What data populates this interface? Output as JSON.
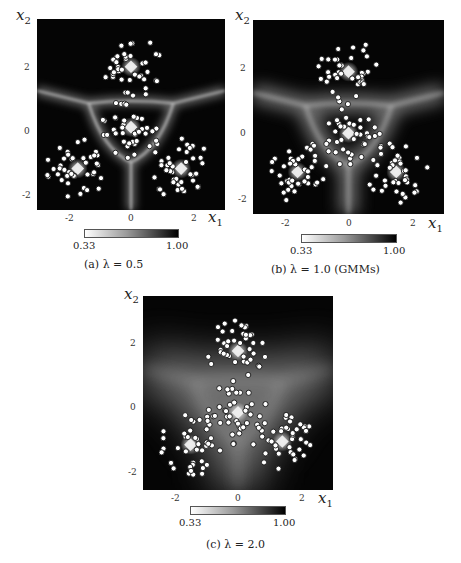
{
  "chart_data": [
    {
      "type": "heatmap",
      "title": "(a) λ = 0.5",
      "subplot_label": "(a)",
      "lambda": "0.5",
      "xlabel": "x1",
      "ylabel": "x2",
      "xticks": [
        "-2",
        "0",
        "2"
      ],
      "yticks": [
        "2",
        "0",
        "-2"
      ],
      "xlim": [
        -3,
        3
      ],
      "ylim": [
        -2.5,
        3.5
      ],
      "colorbar": {
        "min_label": "0.33",
        "max_label": "1.00",
        "min": 0.33,
        "max": 1.0,
        "gradient": "white-to-black"
      },
      "cluster_centers": [
        [
          0.0,
          2.0
        ],
        [
          0.0,
          0.1
        ],
        [
          -1.7,
          -1.2
        ],
        [
          1.6,
          -1.2
        ]
      ],
      "boundary_sharpness": "sharp",
      "points_per_cluster_approx": 40
    },
    {
      "type": "heatmap",
      "title": "(b) λ = 1.0 (GMMs)",
      "subplot_label": "(b)",
      "lambda": "1.0",
      "note": "(GMMs)",
      "xlabel": "x1",
      "ylabel": "x2",
      "xticks": [
        "-2",
        "0",
        "2"
      ],
      "yticks": [
        "2",
        "0",
        "-2"
      ],
      "xlim": [
        -3,
        3
      ],
      "ylim": [
        -2.5,
        3.5
      ],
      "colorbar": {
        "min_label": "0.33",
        "max_label": "1.00",
        "min": 0.33,
        "max": 1.0,
        "gradient": "white-to-black"
      },
      "cluster_centers": [
        [
          0.0,
          1.9
        ],
        [
          0.0,
          0.0
        ],
        [
          -1.6,
          -1.2
        ],
        [
          1.5,
          -1.2
        ]
      ],
      "boundary_sharpness": "medium",
      "points_per_cluster_approx": 40
    },
    {
      "type": "heatmap",
      "title": "(c) λ = 2.0",
      "subplot_label": "(c)",
      "lambda": "2.0",
      "xlabel": "x1",
      "ylabel": "x2",
      "xticks": [
        "-2",
        "0",
        "2"
      ],
      "yticks": [
        "2",
        "0",
        "-2"
      ],
      "xlim": [
        -3,
        3
      ],
      "ylim": [
        -2.5,
        3.5
      ],
      "colorbar": {
        "min_label": "0.33",
        "max_label": "1.00",
        "min": 0.33,
        "max": 1.0,
        "gradient": "white-to-black"
      },
      "cluster_centers": [
        [
          0.0,
          1.8
        ],
        [
          0.0,
          -0.1
        ],
        [
          -1.5,
          -1.1
        ],
        [
          1.4,
          -1.0
        ]
      ],
      "boundary_sharpness": "diffuse",
      "points_per_cluster_approx": 40
    }
  ],
  "panels": {
    "a": {
      "caption": "(a) λ = 0.5",
      "x1": "x",
      "x1_sub": "1",
      "x2": "x",
      "x2_sub": "2",
      "ticks_x": [
        "-2",
        "0",
        "2"
      ],
      "ticks_y": [
        "2",
        "0",
        "-2"
      ],
      "cb_min": "0.33",
      "cb_max": "1.00"
    },
    "b": {
      "caption": "(b) λ = 1.0 (GMMs)",
      "x1": "x",
      "x1_sub": "1",
      "x2": "x",
      "x2_sub": "2",
      "ticks_x": [
        "-2",
        "0",
        "2"
      ],
      "ticks_y": [
        "2",
        "0",
        "-2"
      ],
      "cb_min": "0.33",
      "cb_max": "1.00"
    },
    "c": {
      "caption": "(c) λ = 2.0",
      "x1": "x",
      "x1_sub": "1",
      "x2": "x",
      "x2_sub": "2",
      "ticks_x": [
        "-2",
        "0",
        "2"
      ],
      "ticks_y": [
        "2",
        "0",
        "-2"
      ],
      "cb_min": "0.33",
      "cb_max": "1.00"
    }
  }
}
